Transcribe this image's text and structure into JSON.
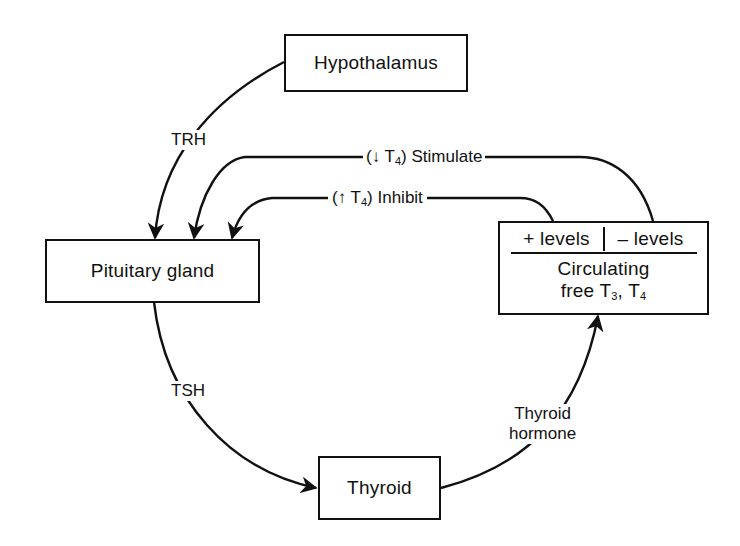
{
  "nodes": {
    "hypothalamus": {
      "label": "Hypothalamus"
    },
    "pituitary": {
      "label": "Pituitary gland"
    },
    "thyroid": {
      "label": "Thyroid"
    },
    "circulating": {
      "plus_levels": "+  levels",
      "minus_levels": "–  levels",
      "line1": "Circulating",
      "line2_prefix": "free T",
      "t3_sub": "3",
      "sep": ", T",
      "t4_sub": "4"
    }
  },
  "edges": {
    "trh": {
      "label": "TRH",
      "from": "Hypothalamus",
      "to": "Pituitary gland"
    },
    "tsh": {
      "label": "TSH",
      "from": "Pituitary gland",
      "to": "Thyroid"
    },
    "thyroid_hormone": {
      "label_line1": "Thyroid",
      "label_line2": "hormone",
      "from": "Thyroid",
      "to": "Circulating free T3, T4"
    },
    "stimulate": {
      "prefix": "(↓ T",
      "sub": "4",
      "suffix": ") Stimulate",
      "from": "– levels",
      "to": "Pituitary gland"
    },
    "inhibit": {
      "prefix": "(↑ T",
      "sub": "4",
      "suffix": ") Inhibit",
      "from": "+ levels",
      "to": "Pituitary gland"
    }
  },
  "colors": {
    "stroke": "#111111",
    "background": "#ffffff"
  }
}
